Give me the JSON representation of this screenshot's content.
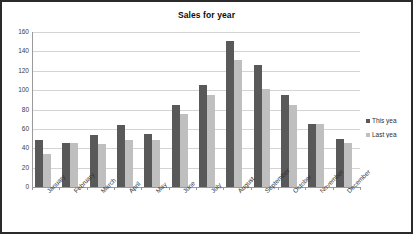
{
  "chart_data": {
    "type": "bar",
    "title": "Sales for year",
    "xlabel": "",
    "ylabel": "",
    "ylim": [
      0,
      160
    ],
    "ytick_step": 20,
    "yticks": [
      0,
      20,
      40,
      60,
      80,
      100,
      120,
      140,
      160
    ],
    "grid": true,
    "legend_position": "right",
    "categories": [
      "January",
      "February",
      "March",
      "April",
      "May",
      "June",
      "July",
      "August",
      "September",
      "October",
      "November",
      "December"
    ],
    "series": [
      {
        "name": "This yea",
        "full_name": "This year",
        "color": "#595959",
        "values": [
          49,
          45,
          54,
          64,
          55,
          85,
          105,
          151,
          126,
          95,
          65,
          50
        ]
      },
      {
        "name": "Last yea",
        "full_name": "Last year",
        "color": "#bfbfbf",
        "values": [
          34,
          45,
          44,
          49,
          49,
          75,
          95,
          131,
          101,
          85,
          65,
          45
        ]
      }
    ]
  },
  "style": {
    "frame_border_color": "#2b2b2b",
    "plot_background": "#ffffff",
    "gridline_color": "#d4d4d4",
    "axis_color": "#9a9a9a",
    "title_color": "#0d0d0d",
    "tick_label_color": "#3d3d3d"
  }
}
